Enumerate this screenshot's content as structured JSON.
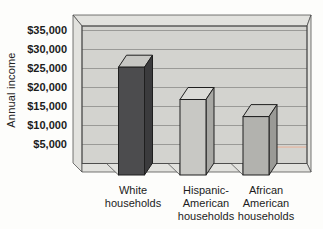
{
  "chart_data": {
    "type": "bar",
    "title": "",
    "ylabel": "Annual income",
    "categories": [
      {
        "label": "White households",
        "lines": [
          "White",
          "households"
        ]
      },
      {
        "label": "Hispanic-American households",
        "lines": [
          "Hispanic-",
          "American",
          "households"
        ]
      },
      {
        "label": "African American households",
        "lines": [
          "African",
          "American",
          "households"
        ]
      }
    ],
    "values": [
      28500,
      20000,
      15500
    ],
    "y_ticks": [
      {
        "value": 35000,
        "label": "$35,000"
      },
      {
        "value": 30000,
        "label": "$30,000"
      },
      {
        "value": 25000,
        "label": "$25,000"
      },
      {
        "value": 20000,
        "label": "$20,000"
      },
      {
        "value": 15000,
        "label": "$15,000"
      },
      {
        "value": 10000,
        "label": "$10,000"
      },
      {
        "value": 5000,
        "label": "$5,000"
      }
    ],
    "ylim": [
      0,
      36500
    ],
    "grid": true,
    "legend": false,
    "style": "3d-extruded-bars",
    "bar_colors": [
      {
        "front": "#4c4c4e",
        "top": "#c7c7c3",
        "side": "#3b3b3d"
      },
      {
        "front": "#c8c8c4",
        "top": "#dbdbd7",
        "side": "#a8a8a4"
      },
      {
        "front": "#b2b2ae",
        "top": "#c9c9c5",
        "side": "#9a9a96"
      }
    ],
    "wall_color": "#d3d3cf",
    "frame_color": "#e2e2de",
    "gridline_color": "#9a9a97",
    "outline_color": "#4a4a4a",
    "bar_outline_color": "#1f1f1f",
    "text_color": "#1c1c1c",
    "background_color": "#fdfdfb",
    "artifact_color": "#e7b49c"
  }
}
